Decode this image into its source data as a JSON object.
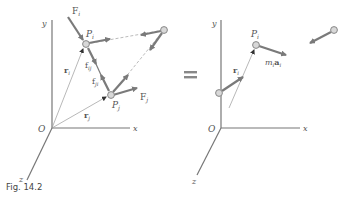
{
  "figure": {
    "caption": "Fig. 14.2",
    "equals_sign": "="
  },
  "left_diagram": {
    "axes": {
      "x": "x",
      "y": "y",
      "z": "z",
      "origin": "O"
    },
    "particles": [
      {
        "label": "P",
        "sub": "i",
        "pos": [
          86,
          44
        ]
      },
      {
        "label": "P",
        "sub": "j",
        "pos": [
          111,
          95
        ]
      },
      {
        "label": "",
        "sub": "",
        "pos": [
          164,
          30
        ]
      }
    ],
    "position_vectors": [
      {
        "label": "r",
        "sub": "i"
      },
      {
        "label": "r",
        "sub": "j"
      }
    ],
    "external_forces": [
      {
        "label": "F",
        "sub": "i"
      },
      {
        "label": "F",
        "sub": "j"
      }
    ],
    "internal_forces": [
      {
        "label": "f",
        "sub": "ij"
      },
      {
        "label": "f",
        "sub": "ji"
      }
    ]
  },
  "right_diagram": {
    "axes": {
      "x": "x",
      "y": "y",
      "z": "z",
      "origin": "O"
    },
    "particles": [
      {
        "label": "P",
        "sub": "i",
        "pos": [
          256,
          45
        ]
      },
      {
        "label": "",
        "sub": "",
        "pos": [
          334,
          30
        ]
      },
      {
        "label": "",
        "sub": "",
        "pos": [
          219,
          93
        ]
      }
    ],
    "position_vectors": [
      {
        "label": "r",
        "sub": "i"
      }
    ],
    "effective_forces": [
      {
        "label": "m",
        "sub_m": "i",
        "label2": "a",
        "sub_a": "i"
      }
    ]
  },
  "colors": {
    "axis": "#777777",
    "vector": "#7a7a7a",
    "particle_fill": "#d8d8d8",
    "particle_stroke": "#888888",
    "text": "#555555"
  }
}
